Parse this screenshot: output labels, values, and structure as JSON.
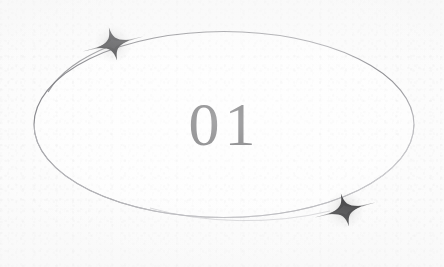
{
  "page": {
    "title": "01",
    "background_color": "#fbfbfb",
    "width": 444,
    "height": 267
  },
  "badge": {
    "number_label": "01",
    "number_color": "#3a3a3d",
    "shape": "ellipse",
    "shape_outline_color": "#6f6f74",
    "shape_fill_color": "#fdfdfd",
    "ellipse": {
      "center_x": 224,
      "center_y": 124,
      "radius_x": 190,
      "radius_y": 93,
      "stroke_width": 1.1
    },
    "decorations": [
      {
        "name": "sparkle-top-left",
        "icon": "four-point-star-icon",
        "color": "#151518",
        "x": 113,
        "y": 44,
        "size": 34,
        "rotation_deg": -14
      },
      {
        "name": "sparkle-bottom-right",
        "icon": "four-point-star-icon",
        "color": "#151518",
        "x": 345,
        "y": 210,
        "size": 34,
        "rotation_deg": -14
      }
    ]
  }
}
